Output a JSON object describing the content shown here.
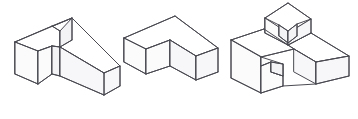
{
  "sheet": {
    "title": "Isometric Block Drawings",
    "description": "Three hand-drawn pictorial (isometric) line drawings of solid blocks with notches and steps, arranged left to right on a plain white sheet.",
    "background_color": "#ffffff",
    "line_color": "#4a4a52",
    "line_width": 1,
    "width": 358,
    "height": 119,
    "figure_count": 3,
    "style": "hand-drawn isometric line drawing, no shading, no labels"
  },
  "figures": [
    {
      "id": "figure-1",
      "name": "notched-z-block",
      "label": "",
      "description": "Long rectangular block drawn in isometric view with a narrow rectangular slot cut through the upper left portion, forming a Z / N-like profile.",
      "bounds": {
        "x": 14,
        "y": 14,
        "width": 106,
        "height": 90
      },
      "faces": {
        "top": "#ffffff",
        "left": "#fbfbfc",
        "right": "#f7f7f9",
        "inner": "#f3f3f5"
      },
      "geometry": {
        "top_face": "15,42 72,18 120,66 104,73 100,69 60,47 54,49 52,46 38,51 30,48",
        "outline": "15,42 72,18 120,66 120,86 104,95 104,73",
        "slot": "52,46 60,47 60,76 52,74"
      }
    },
    {
      "id": "figure-2",
      "name": "l-shaped-chevron-block",
      "label": "",
      "description": "Solid L-shaped (chevron / bent bar) block in isometric view, with two straight arms meeting at a right-angle corner pointing toward the viewer.",
      "bounds": {
        "x": 124,
        "y": 16,
        "width": 94,
        "height": 74
      },
      "faces": {
        "top": "#ffffff",
        "left": "#fbfbfc",
        "right": "#f7f7f9",
        "inner": "#f3f3f5"
      },
      "geometry": {
        "top_face": "124,38 175,16 218,48 196,56 170,40 146,49",
        "outline": "124,38 124,62 146,74 170,66 196,80 218,72 218,48",
        "inner_edge": "170,40 170,66"
      }
    },
    {
      "id": "figure-3",
      "name": "stepped-block-with-raised-notched-top",
      "label": "",
      "description": "Compound isometric block: a left block with a rectangular step notch, a long right arm, and a smaller raised block on top that has a V-shaped notch cut into its near corner.",
      "bounds": {
        "x": 231,
        "y": 3,
        "width": 119,
        "height": 93
      },
      "faces": {
        "top": "#ffffff",
        "left": "#fbfbfc",
        "right": "#f7f7f9",
        "inner": "#f3f3f5"
      },
      "geometry": {
        "left_block_top": "231,40 264,29 294,49 264,61",
        "left_block_outline": "231,40 231,78 261,93 294,81 294,49",
        "step_notch": "261,57 283,64 283,76 271,72 271,62 261,66",
        "raised_block_top": "265,18 288,3 311,19 288,33",
        "raised_block_outline": "265,18 265,33 288,45 311,33 311,19",
        "raised_block_notch": "279,25 288,31 297,24 297,36 288,43 279,36",
        "right_arm_top": "294,33 330,31 349,56 316,62",
        "right_arm_outline": "294,33 294,49 316,62 316,84 349,76 349,56"
      }
    }
  ]
}
